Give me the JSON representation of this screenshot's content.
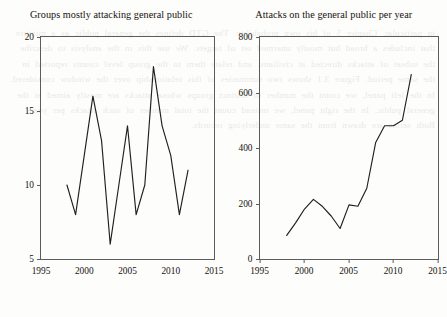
{
  "background_text": "in particular, Chapter 5 of his own probability. The GTD defines the general public as a mixture that includes a broad but mostly unarmed set of targets. We use this in the analysis to describe the subset of attacks directed at civilians, and relate them to the group level counts reported in the same period. Figure 3.1 shows two summaries of this relationship over the window considered. In the left panel, we count the number of distinct groups whose attacks are mostly aimed at the general public. In the right panel, we instead count the total number of such attacks per year. Both series are drawn from the same underlying records.",
  "figure": {
    "panels": [
      {
        "name": "groups-panel",
        "chart_data": {
          "type": "line",
          "title": "Groups mostly attacking general public",
          "xlabel": "",
          "ylabel": "",
          "xlim": [
            1995,
            2015
          ],
          "ylim": [
            5,
            20
          ],
          "xticks": [
            1995,
            2000,
            2005,
            2010,
            2015
          ],
          "yticks": [
            5,
            10,
            15,
            20
          ],
          "grid": false,
          "legend": false,
          "x": [
            1998,
            1999,
            2000,
            2001,
            2002,
            2003,
            2004,
            2005,
            2006,
            2007,
            2008,
            2009,
            2010,
            2011,
            2012
          ],
          "values": [
            10,
            8,
            12,
            16,
            13,
            6,
            10,
            14,
            8,
            10,
            18,
            14,
            12,
            8,
            11
          ]
        }
      },
      {
        "name": "attacks-panel",
        "chart_data": {
          "type": "line",
          "title": "Attacks on the general public per year",
          "xlabel": "",
          "ylabel": "",
          "xlim": [
            1995,
            2015
          ],
          "ylim": [
            0,
            800
          ],
          "xticks": [
            1995,
            2000,
            2005,
            2010,
            2015
          ],
          "yticks": [
            0,
            200,
            400,
            600,
            800
          ],
          "grid": false,
          "legend": false,
          "x": [
            1998,
            1999,
            2000,
            2001,
            2002,
            2003,
            2004,
            2005,
            2006,
            2007,
            2008,
            2009,
            2010,
            2011,
            2012
          ],
          "values": [
            85,
            130,
            180,
            215,
            190,
            155,
            110,
            195,
            190,
            255,
            420,
            480,
            480,
            500,
            665
          ]
        }
      }
    ]
  },
  "colors": {
    "line": "#20201e",
    "axis": "#5c5c5c",
    "text": "#16120e",
    "background": "#fdfdfb"
  }
}
